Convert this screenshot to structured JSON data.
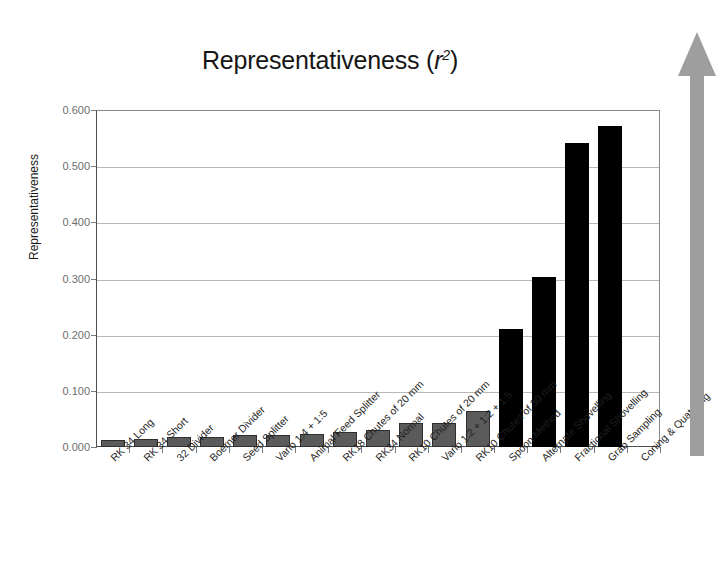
{
  "chart_data": {
    "type": "bar",
    "title": "Representativeness (r2)",
    "title_main": "Representativeness (",
    "title_var": "r",
    "title_exp": "2",
    "title_close": ")",
    "xlabel": "",
    "ylabel": "Representativeness",
    "ylim": [
      0.0,
      0.6
    ],
    "ytick_step": 0.1,
    "grid": true,
    "legend": "none",
    "yticks": [
      "0.000",
      "0.100",
      "0.200",
      "0.300",
      "0.400",
      "0.500",
      "0.600"
    ],
    "ytick_values": [
      0.0,
      0.1,
      0.2,
      0.3,
      0.4,
      0.5,
      0.6
    ],
    "categories": [
      "RK 34 Long",
      "RK 34 Short",
      "32 Divider",
      "Boerner Divider",
      "Seed Splitter",
      "Vario 1:4 + 1:5",
      "Animal Feed Splitter",
      "RK18 Chutes of 20 mm",
      "RK34 Normal",
      "RK10 Chutes of 20 mm",
      "Vario 1:2 + 1:2 + 1:5",
      "RK10 Chutes of 30 mm",
      "Spoon Method",
      "Alternate Shovelling",
      "Fractional Shovelling",
      "Grab Sampling",
      "Coning & Quatering"
    ],
    "values": [
      0.012,
      0.014,
      0.017,
      0.017,
      0.021,
      0.022,
      0.023,
      0.026,
      0.03,
      0.042,
      0.043,
      0.065,
      0.21,
      0.302,
      0.542,
      0.571,
      null
    ],
    "bar_colors": [
      "#5b5b5b",
      "#5b5b5b",
      "#5b5b5b",
      "#5b5b5b",
      "#5b5b5b",
      "#5b5b5b",
      "#5b5b5b",
      "#5b5b5b",
      "#5b5b5b",
      "#5b5b5b",
      "#5b5b5b",
      "#5b5b5b",
      "#000000",
      "#000000",
      "#000000",
      "#000000",
      "none"
    ],
    "annotations": [
      {
        "name": "improvement-arrow",
        "direction": "up",
        "color": "#9e9e9e"
      }
    ]
  },
  "colors": {
    "bar_gray": "#5b5b5b",
    "bar_black": "#000000",
    "arrow_gray": "#9e9e9e",
    "gridline": "#b8b8b8",
    "axis": "#4d4d4d",
    "tick_text": "#6e6e6e",
    "label_text": "#1f1f1f",
    "background": "#ffffff"
  }
}
